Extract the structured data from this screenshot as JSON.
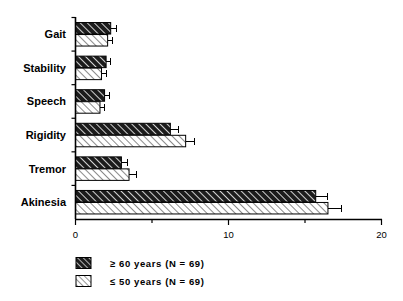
{
  "chart_data": {
    "type": "bar",
    "orientation": "horizontal",
    "title": "",
    "subtitle": "",
    "xlabel": "",
    "ylabel": "",
    "xlim": [
      0,
      20
    ],
    "ylim": null,
    "grid": false,
    "legend_position": "bottom-left",
    "categories": [
      "Gait",
      "Stability",
      "Speech",
      "Rigidity",
      "Tremor",
      "Akinesia"
    ],
    "x_ticks_major": [
      0,
      10,
      20
    ],
    "x_tick_labels": [
      "0",
      "10",
      "20"
    ],
    "x_ticks_minor": [
      5,
      15
    ],
    "series": [
      {
        "name": "≥ 60 years (N = 69)",
        "pattern": "dark-hatch",
        "color": "#1a1a1a",
        "values": [
          2.3,
          2.0,
          1.9,
          6.2,
          3.0,
          15.7
        ],
        "errors": [
          0.35,
          0.3,
          0.35,
          0.5,
          0.4,
          0.8
        ]
      },
      {
        "name": "≤ 50 years (N = 69)",
        "pattern": "light-hatch",
        "color": "#ffffff",
        "values": [
          2.1,
          1.7,
          1.6,
          7.2,
          3.5,
          16.5
        ],
        "errors": [
          0.3,
          0.3,
          0.3,
          0.6,
          0.5,
          0.9
        ]
      }
    ]
  },
  "legend": {
    "items": [
      {
        "label": "≥ 60 years (N = 69)",
        "swatch": "dark-hatch-swatch"
      },
      {
        "label": "≤ 50 years (N = 69)",
        "swatch": "light-hatch-swatch"
      }
    ]
  },
  "axis": {
    "x_labels": [
      "0",
      "10",
      "20"
    ],
    "y_labels": [
      "Gait",
      "Stability",
      "Speech",
      "Rigidity",
      "Tremor",
      "Akinesia"
    ]
  }
}
